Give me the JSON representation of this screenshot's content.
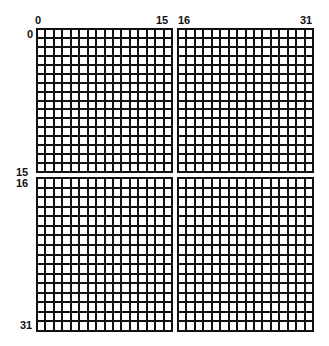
{
  "grid": {
    "rows": 32,
    "cols": 32,
    "quadrant_size": 16
  },
  "column_labels": {
    "c0": "0",
    "c15": "15",
    "c16": "16",
    "c31": "31"
  },
  "row_labels": {
    "r0": "0",
    "r15": "15",
    "r16": "16",
    "r31": "31"
  },
  "quadrants": [
    {
      "name": "top-left",
      "rows": [
        0,
        15
      ],
      "cols": [
        0,
        15
      ]
    },
    {
      "name": "top-right",
      "rows": [
        0,
        15
      ],
      "cols": [
        16,
        31
      ]
    },
    {
      "name": "bottom-left",
      "rows": [
        16,
        31
      ],
      "cols": [
        0,
        15
      ]
    },
    {
      "name": "bottom-right",
      "rows": [
        16,
        31
      ],
      "cols": [
        16,
        31
      ]
    }
  ],
  "colors": {
    "line": "#111111",
    "cell": "#ffffff"
  }
}
